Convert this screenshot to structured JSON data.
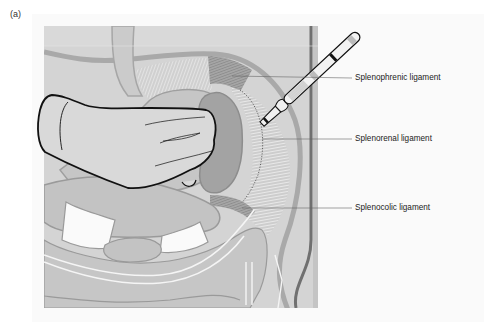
{
  "figure": {
    "panel_label": "(a)",
    "labels": [
      {
        "id": "splenophrenic",
        "text": "Splenophrenic ligament",
        "x": 355,
        "y": 73
      },
      {
        "id": "splenorenal",
        "text": "Splenorenal ligament",
        "x": 355,
        "y": 134
      },
      {
        "id": "splenocolic",
        "text": "Splenocolic ligament",
        "x": 355,
        "y": 203
      }
    ],
    "elements": [
      "hand",
      "spleen",
      "scalpel",
      "stomach",
      "colon",
      "small-intestine",
      "diaphragm",
      "abdominal-wall"
    ],
    "colors": {
      "background": "#d4d4d4",
      "organ": "#bdbdbd",
      "organ_outline": "#8f8f8f",
      "spleen": "#9e9e9e",
      "ligament_stripe": "#e6e6e6",
      "ligament_dark": "#8a8a8a",
      "hand_fill": "#d9d9d9",
      "outline": "#111111",
      "wall_dark": "#6a6a6a"
    }
  }
}
